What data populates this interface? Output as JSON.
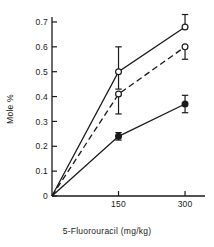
{
  "chart_data": {
    "type": "line",
    "title": "",
    "xlabel": "5-Fluorouracil  (mg/kg)",
    "ylabel": "Mole  %",
    "x": [
      0,
      150,
      300
    ],
    "xtick_labels": [
      "150",
      "300"
    ],
    "xtick_values": [
      150,
      300
    ],
    "xlim": [
      0,
      345
    ],
    "ylim": [
      0,
      0.72
    ],
    "ytick_labels": [
      "0",
      "0.1",
      "0.2",
      "0.3",
      "0.4",
      "0.5",
      "0.6",
      "0.7"
    ],
    "ytick_values": [
      0,
      0.1,
      0.2,
      0.3,
      0.4,
      0.5,
      0.6,
      0.7
    ],
    "grid": false,
    "legend": "none",
    "series": [
      {
        "name": "series-upper-open-circle-solid",
        "marker": "open-circle",
        "line": "solid",
        "values": [
          0,
          0.5,
          0.68
        ],
        "err_up": [
          0,
          0.1,
          0.05
        ],
        "err_down": [
          0,
          0.07,
          0.0
        ]
      },
      {
        "name": "series-middle-open-circle-dashed",
        "marker": "open-circle",
        "line": "dashed",
        "values": [
          0,
          0.41,
          0.6
        ],
        "err_up": [
          0,
          0.0,
          0.0
        ],
        "err_down": [
          0,
          0.08,
          0.05
        ]
      },
      {
        "name": "series-lower-filled-circle-solid",
        "marker": "filled-circle",
        "line": "solid",
        "values": [
          0,
          0.24,
          0.37
        ],
        "err_up": [
          0,
          0.015,
          0.035
        ],
        "err_down": [
          0,
          0.015,
          0.035
        ]
      }
    ]
  },
  "axes": {
    "x_title": "5-Fluorouracil  (mg/kg)",
    "y_title": "Mole  %"
  }
}
